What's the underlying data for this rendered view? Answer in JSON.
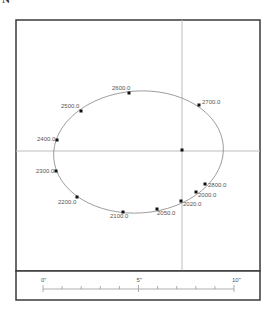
{
  "north_label": "N",
  "plot": {
    "frame": {
      "x": 16,
      "y": 20,
      "width": 244,
      "height": 251
    },
    "crosshair": {
      "x": 182,
      "y": 151,
      "color": "#bdbdbd"
    },
    "center_point": {
      "x": 182,
      "y": 150
    },
    "ellipse": {
      "cx": 138.5,
      "cy": 152,
      "rx": 85,
      "ry": 61,
      "rotate": -4,
      "color": "#888888"
    },
    "points": [
      {
        "label": "2600.0",
        "x": 129,
        "y": 93,
        "lx": 112,
        "ly": 90
      },
      {
        "label": "2700.0",
        "x": 199,
        "y": 105,
        "lx": 202,
        "ly": 104
      },
      {
        "label": "2500.0",
        "x": 81,
        "y": 111,
        "lx": 61,
        "ly": 108
      },
      {
        "label": "2400.0",
        "x": 57,
        "y": 140,
        "lx": 37,
        "ly": 141
      },
      {
        "label": "2300.0",
        "x": 56,
        "y": 171,
        "lx": 36,
        "ly": 173
      },
      {
        "label": "2200.0",
        "x": 77,
        "y": 197,
        "lx": 58,
        "ly": 204
      },
      {
        "label": "2100.0",
        "x": 123,
        "y": 212,
        "lx": 110,
        "ly": 218
      },
      {
        "label": "2050.0",
        "x": 157,
        "y": 209,
        "lx": 157,
        "ly": 215
      },
      {
        "label": "2020.0",
        "x": 181,
        "y": 201,
        "lx": 183,
        "ly": 206
      },
      {
        "label": "2000.0",
        "x": 196,
        "y": 192,
        "lx": 198,
        "ly": 197
      },
      {
        "label": "2800.0",
        "x": 205,
        "y": 184,
        "lx": 208,
        "ly": 187
      }
    ]
  },
  "scale_bar": {
    "frame": {
      "x": 16,
      "y": 271,
      "width": 244,
      "height": 29
    },
    "x0": 43,
    "x10": 234,
    "baseline_y": 289,
    "labels": [
      {
        "text": "0\"",
        "value": 0
      },
      {
        "text": "5\"",
        "value": 5
      },
      {
        "text": "10\"",
        "value": 10
      }
    ],
    "ticks": [
      0,
      1,
      2,
      3,
      4,
      5,
      6,
      7,
      8,
      9,
      10
    ]
  }
}
